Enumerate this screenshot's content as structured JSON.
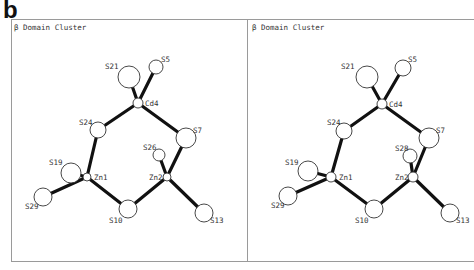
{
  "figure": {
    "label": "b",
    "panels": [
      {
        "title": "β Domain Cluster",
        "atoms": [
          {
            "id": "S21",
            "x": 129,
            "y": 77,
            "r": 11,
            "lx": 105,
            "ly": 69
          },
          {
            "id": "S5",
            "x": 156,
            "y": 67,
            "r": 7,
            "lx": 161,
            "ly": 62
          },
          {
            "id": "Cd4",
            "x": 138,
            "y": 103,
            "r": 5,
            "lx": 145,
            "ly": 106
          },
          {
            "id": "S24",
            "x": 98,
            "y": 130,
            "r": 8,
            "lx": 79,
            "ly": 125
          },
          {
            "id": "S7",
            "x": 186,
            "y": 138,
            "r": 10,
            "lx": 193,
            "ly": 133
          },
          {
            "id": "S26",
            "x": 159,
            "y": 155,
            "r": 6,
            "lx": 143,
            "ly": 150
          },
          {
            "id": "Zn1",
            "x": 87,
            "y": 177,
            "r": 4,
            "lx": 94,
            "ly": 180
          },
          {
            "id": "Zn2",
            "x": 167,
            "y": 177,
            "r": 4,
            "lx": 149,
            "ly": 180
          },
          {
            "id": "S19",
            "x": 71,
            "y": 173,
            "r": 10,
            "lx": 49,
            "ly": 165
          },
          {
            "id": "S29",
            "x": 43,
            "y": 197,
            "r": 9,
            "lx": 25,
            "ly": 209
          },
          {
            "id": "S10",
            "x": 128,
            "y": 209,
            "r": 9,
            "lx": 109,
            "ly": 223
          },
          {
            "id": "S13",
            "x": 204,
            "y": 213,
            "r": 9,
            "lx": 210,
            "ly": 223
          }
        ],
        "bonds": [
          [
            "Cd4",
            "S21"
          ],
          [
            "Cd4",
            "S5"
          ],
          [
            "Cd4",
            "S24"
          ],
          [
            "Cd4",
            "S7"
          ],
          [
            "Zn1",
            "S24"
          ],
          [
            "Zn1",
            "S19"
          ],
          [
            "Zn1",
            "S29"
          ],
          [
            "Zn1",
            "S10"
          ],
          [
            "Zn2",
            "S7"
          ],
          [
            "Zn2",
            "S26"
          ],
          [
            "Zn2",
            "S10"
          ],
          [
            "Zn2",
            "S13"
          ]
        ]
      },
      {
        "title": "β Domain Cluster",
        "atoms": [
          {
            "id": "S21",
            "x": 367,
            "y": 77,
            "r": 11,
            "lx": 341,
            "ly": 69
          },
          {
            "id": "S5",
            "x": 403,
            "y": 68,
            "r": 8,
            "lx": 408,
            "ly": 62
          },
          {
            "id": "Cd4",
            "x": 382,
            "y": 104,
            "r": 5,
            "lx": 389,
            "ly": 107
          },
          {
            "id": "S24",
            "x": 344,
            "y": 131,
            "r": 8,
            "lx": 327,
            "ly": 125
          },
          {
            "id": "S7",
            "x": 429,
            "y": 138,
            "r": 10,
            "lx": 436,
            "ly": 133
          },
          {
            "id": "S28",
            "x": 410,
            "y": 156,
            "r": 7,
            "lx": 395,
            "ly": 151
          },
          {
            "id": "Zn1",
            "x": 331,
            "y": 177,
            "r": 5,
            "lx": 339,
            "ly": 180
          },
          {
            "id": "Zn2",
            "x": 413,
            "y": 177,
            "r": 5,
            "lx": 395,
            "ly": 180
          },
          {
            "id": "S19",
            "x": 308,
            "y": 171,
            "r": 10,
            "lx": 285,
            "ly": 165
          },
          {
            "id": "S29",
            "x": 288,
            "y": 196,
            "r": 9,
            "lx": 271,
            "ly": 208
          },
          {
            "id": "S10",
            "x": 374,
            "y": 209,
            "r": 9,
            "lx": 355,
            "ly": 223
          },
          {
            "id": "S13",
            "x": 450,
            "y": 213,
            "r": 9,
            "lx": 456,
            "ly": 223
          }
        ],
        "bonds": [
          [
            "Cd4",
            "S21"
          ],
          [
            "Cd4",
            "S5"
          ],
          [
            "Cd4",
            "S24"
          ],
          [
            "Cd4",
            "S7"
          ],
          [
            "Zn1",
            "S24"
          ],
          [
            "Zn1",
            "S19"
          ],
          [
            "Zn1",
            "S29"
          ],
          [
            "Zn1",
            "S10"
          ],
          [
            "Zn2",
            "S7"
          ],
          [
            "Zn2",
            "S28"
          ],
          [
            "Zn2",
            "S10"
          ],
          [
            "Zn2",
            "S13"
          ]
        ]
      }
    ]
  },
  "colors": {
    "bond": "#111111",
    "atom_stroke": "#333333",
    "atom_fill": "#ffffff",
    "frame": "#9a9a9a"
  }
}
